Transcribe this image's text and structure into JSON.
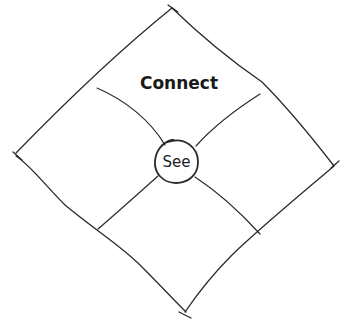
{
  "diagram": {
    "type": "rotated-square-quadrant",
    "background": "#ffffff",
    "stroke_color": "#2a2a2a",
    "center": {
      "label": "See",
      "shape": "circle"
    },
    "quadrants": [
      {
        "position": "top",
        "label": "Connect"
      },
      {
        "position": "right",
        "label": ""
      },
      {
        "position": "bottom",
        "label": ""
      },
      {
        "position": "left",
        "label": ""
      }
    ]
  }
}
